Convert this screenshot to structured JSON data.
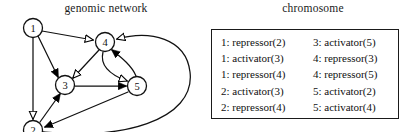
{
  "network": {
    "title": "genomic network",
    "nodes": [
      {
        "id": "1",
        "label": "1",
        "cx": 33,
        "cy": 28,
        "r": 9.5
      },
      {
        "id": "2",
        "label": "2",
        "cx": 33,
        "cy": 130,
        "r": 9.5
      },
      {
        "id": "3",
        "label": "3",
        "cx": 65,
        "cy": 85,
        "r": 9.5
      },
      {
        "id": "4",
        "label": "4",
        "cx": 105,
        "cy": 42,
        "r": 9.5
      },
      {
        "id": "5",
        "label": "5",
        "cx": 137,
        "cy": 86,
        "r": 9.5
      }
    ],
    "edges": [
      {
        "from": "1",
        "to": "4",
        "type": "repressor",
        "arrow": "hollow"
      },
      {
        "from": "1",
        "to": "3",
        "type": "activator",
        "arrow": "filled"
      },
      {
        "from": "1",
        "to": "2",
        "type": "repressor",
        "arrow": "hollow"
      },
      {
        "from": "2",
        "to": "3",
        "type": "activator",
        "arrow": "filled"
      },
      {
        "from": "2",
        "to": "4",
        "type": "repressor",
        "arrow": "hollow"
      },
      {
        "from": "3",
        "to": "5",
        "type": "activator",
        "arrow": "filled"
      },
      {
        "from": "4",
        "to": "3",
        "type": "repressor",
        "arrow": "hollow"
      },
      {
        "from": "4",
        "to": "5",
        "type": "repressor",
        "arrow": "hollow"
      },
      {
        "from": "5",
        "to": "4",
        "type": "activator",
        "arrow": "filled"
      },
      {
        "from": "5",
        "to": "2",
        "type": "activator",
        "arrow": "filled"
      }
    ],
    "legend": {
      "filled_arrow_meaning": "activator",
      "hollow_arrow_meaning": "repressor"
    }
  },
  "chromosome": {
    "title": "chromosome",
    "columns": [
      {
        "entries": [
          "1: repressor(2)",
          "1: activator(3)",
          "1: repressor(4)",
          "2: activator(3)",
          "2: repressor(4)"
        ]
      },
      {
        "entries": [
          "3: activator(5)",
          "4: repressor(3)",
          "4: repressor(5)",
          "5: activator(2)",
          "5: activator(4)"
        ]
      }
    ]
  },
  "colors": {
    "ink": "#111111",
    "background": "#ffffff",
    "arrow_fill": "#000000",
    "arrow_hollow": "#ffffff"
  }
}
